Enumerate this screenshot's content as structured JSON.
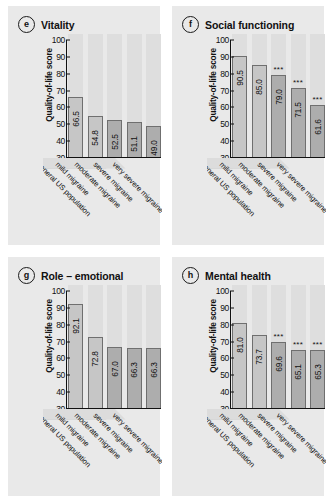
{
  "figure": {
    "categories": [
      "general US population",
      "mild migraine",
      "moderate migraine",
      "severe migraine",
      "very severe migraine"
    ],
    "y_axis": {
      "label": "Quality-of-life score",
      "ticks": [
        "100",
        "90",
        "80",
        "70",
        "60",
        "50",
        "40",
        "30"
      ],
      "min": 30,
      "max": 100
    },
    "significance_marker": "***",
    "colors": {
      "panel_background": "#e9e9e9",
      "column_background": "#dedede",
      "bar_light": "#c6c6c6",
      "bar_dark": "#adadad",
      "bar_outline": "#6f6f6f",
      "axis": "#111111",
      "text": "#111111"
    },
    "panels": [
      {
        "badge": "e",
        "title": "Vitality",
        "values": [
          "66.5",
          "54.8",
          "52.5",
          "51.1",
          "49.0"
        ],
        "stars": [
          "",
          "",
          "",
          "",
          ""
        ]
      },
      {
        "badge": "f",
        "title": "Social functioning",
        "values": [
          "90.5",
          "85.0",
          "79.0",
          "71.5",
          "61.6"
        ],
        "stars": [
          "",
          "",
          "***",
          "***",
          "***"
        ]
      },
      {
        "badge": "g",
        "title": "Role – emotional",
        "values": [
          "92.1",
          "72.8",
          "67.0",
          "66.3",
          "66.3"
        ],
        "stars": [
          "",
          "",
          "",
          "",
          ""
        ]
      },
      {
        "badge": "h",
        "title": "Mental health",
        "values": [
          "81.0",
          "73.7",
          "69.6",
          "65.1",
          "65.3"
        ],
        "stars": [
          "",
          "",
          "***",
          "***",
          "***"
        ]
      }
    ]
  },
  "chart_data": [
    {
      "type": "bar",
      "title": "Vitality",
      "panel_label": "e",
      "categories": [
        "general US population",
        "mild migraine",
        "moderate migraine",
        "severe migraine",
        "very severe migraine"
      ],
      "values": [
        66.5,
        54.8,
        52.5,
        51.1,
        49.0
      ],
      "annotations": [
        "",
        "",
        "",
        "",
        ""
      ],
      "xlabel": "",
      "ylabel": "Quality-of-life score",
      "ylim": [
        30,
        100
      ],
      "yticks": [
        30,
        40,
        50,
        60,
        70,
        80,
        90,
        100
      ],
      "grid": false,
      "legend": "none"
    },
    {
      "type": "bar",
      "title": "Social functioning",
      "panel_label": "f",
      "categories": [
        "general US population",
        "mild migraine",
        "moderate migraine",
        "severe migraine",
        "very severe migraine"
      ],
      "values": [
        90.5,
        85.0,
        79.0,
        71.5,
        61.6
      ],
      "annotations": [
        "",
        "",
        "***",
        "***",
        "***"
      ],
      "xlabel": "",
      "ylabel": "Quality-of-life score",
      "ylim": [
        30,
        100
      ],
      "yticks": [
        30,
        40,
        50,
        60,
        70,
        80,
        90,
        100
      ],
      "grid": false,
      "legend": "none"
    },
    {
      "type": "bar",
      "title": "Role – emotional",
      "panel_label": "g",
      "categories": [
        "general US population",
        "mild migraine",
        "moderate migraine",
        "severe migraine",
        "very severe migraine"
      ],
      "values": [
        92.1,
        72.8,
        67.0,
        66.3,
        66.3
      ],
      "annotations": [
        "",
        "",
        "",
        "",
        ""
      ],
      "xlabel": "",
      "ylabel": "Quality-of-life score",
      "ylim": [
        30,
        100
      ],
      "yticks": [
        30,
        40,
        50,
        60,
        70,
        80,
        90,
        100
      ],
      "grid": false,
      "legend": "none"
    },
    {
      "type": "bar",
      "title": "Mental health",
      "panel_label": "h",
      "categories": [
        "general US population",
        "mild migraine",
        "moderate migraine",
        "severe migraine",
        "very severe migraine"
      ],
      "values": [
        81.0,
        73.7,
        69.6,
        65.1,
        65.3
      ],
      "annotations": [
        "",
        "",
        "***",
        "***",
        "***"
      ],
      "xlabel": "",
      "ylabel": "Quality-of-life score",
      "ylim": [
        30,
        100
      ],
      "yticks": [
        30,
        40,
        50,
        60,
        70,
        80,
        90,
        100
      ],
      "grid": false,
      "legend": "none"
    }
  ]
}
